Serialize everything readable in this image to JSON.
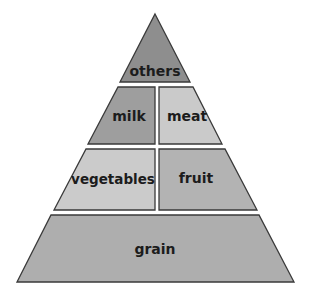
{
  "diagram": {
    "type": "food-pyramid",
    "tiers": [
      {
        "level": 1,
        "sections": [
          {
            "label": "others",
            "color": "#8e8e8e"
          }
        ]
      },
      {
        "level": 2,
        "sections": [
          {
            "label": "milk",
            "color": "#9e9e9e"
          },
          {
            "label": "meat",
            "color": "#cacaca"
          }
        ]
      },
      {
        "level": 3,
        "sections": [
          {
            "label": "vegetables",
            "color": "#cbcbcb"
          },
          {
            "label": "fruit",
            "color": "#b3b3b3"
          }
        ]
      },
      {
        "level": 4,
        "sections": [
          {
            "label": "grain",
            "color": "#aeaeae"
          }
        ]
      }
    ],
    "outline_color": "#3a3a3a",
    "text_color": "#1c1c1c"
  }
}
